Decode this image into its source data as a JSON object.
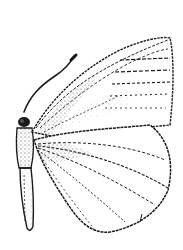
{
  "image": {
    "subject": "butterfly line illustration (side view, wings raised)",
    "background_color": "#ffffff",
    "ink_color": "#1a1a1a",
    "parts": [
      "antenna",
      "head",
      "thorax",
      "abdomen",
      "forewing",
      "hindwing",
      "wing-veins"
    ]
  }
}
